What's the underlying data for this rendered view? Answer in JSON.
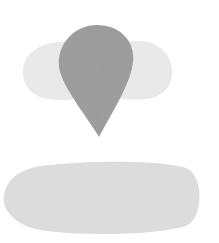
{
  "canvas": {
    "width": 219,
    "height": 243,
    "background": "#ffffff"
  },
  "shapes": {
    "left_lobe": {
      "label": "left light-gray lobe",
      "color": "#ebebeb"
    },
    "right_lobe": {
      "label": "right light-gray lobe",
      "color": "#ebebeb"
    },
    "teardrop": {
      "label": "central gray teardrop",
      "color": "#9b9b9b"
    },
    "base_ellipse": {
      "label": "lower light-gray elongated oval",
      "color": "#dedede"
    }
  }
}
